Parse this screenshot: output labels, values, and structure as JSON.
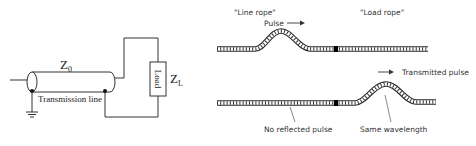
{
  "circuit": {
    "z0_label": "Z",
    "z0_sub": "0",
    "line_label": "Transmission line",
    "load_label": "Load",
    "zl_label": "Z",
    "zl_sub": "L"
  },
  "ropes": {
    "line_rope_label": "\"Line rope\"",
    "load_rope_label": "\"Load rope\"",
    "pulse_label": "Pulse",
    "transmitted_label": "Transmitted pulse",
    "no_reflected_label": "No reflected pulse",
    "same_wavelength_label": "Same wavelength"
  },
  "colors": {
    "line": "#333333",
    "rope": "#2a2a2a",
    "joint": "#000000"
  }
}
